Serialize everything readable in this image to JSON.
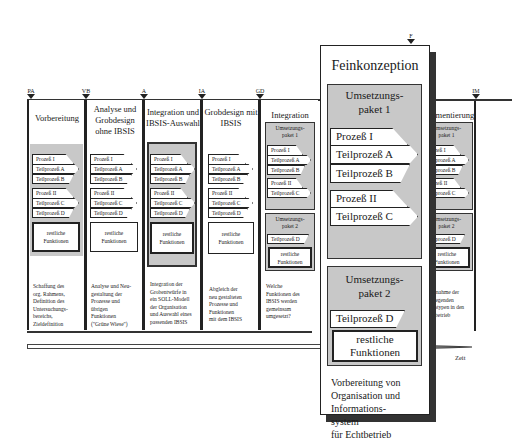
{
  "milestones": [
    "PA",
    "VB",
    "A",
    "IA",
    "GD",
    "F",
    "IM"
  ],
  "phases": [
    {
      "title": "Vorbereitung",
      "marker": "PA",
      "groups": [
        {
          "header": "Prozeß I",
          "items": [
            "Teilprozeß A",
            "Teilprozeß B"
          ]
        },
        {
          "header": "Prozeß II",
          "items": [
            "Teilprozeß C",
            "Teilprozeß D"
          ]
        }
      ],
      "rest": [
        "restliche",
        "Funktionen"
      ],
      "description": [
        "Schaffung des",
        "org. Rahmens,",
        "Definition des",
        "Untersuchungs-",
        "bereichs,",
        "Zieldefinition"
      ]
    },
    {
      "title": "Analyse und Grobdesign ohne IBSIS",
      "marker": "VB",
      "groups": [
        {
          "header": "Prozeß I",
          "items": [
            "Teilprozeß A",
            "Teilprozeß B"
          ]
        },
        {
          "header": "Prozeß II",
          "items": [
            "Teilprozeß C",
            "Teilprozeß D"
          ]
        }
      ],
      "rest": [
        "restliche",
        "Funktionen"
      ],
      "description": [
        "Analyse und Neu-",
        "gestaltung der",
        "Prozesse und",
        "übrigen",
        "Funktionen",
        "(\"Grüne Wiese\")"
      ]
    },
    {
      "title": "Integration und IBSIS-Auswahl",
      "marker": "A",
      "groups": [
        {
          "header": "Prozeß I",
          "items": [
            "Teilprozeß A",
            "Teilprozeß B"
          ]
        },
        {
          "header": "Prozeß II",
          "items": [
            "Teilprozeß C",
            "Teilprozeß D"
          ]
        }
      ],
      "rest": [
        "restliche",
        "Funktionen"
      ],
      "description": [
        "Integration der",
        "Grobentwürfe in",
        "ein SOLL-Modell",
        "der Organisation",
        "und Auswahl eines",
        "passenden IBSIS"
      ]
    },
    {
      "title": "Grobdesign mit IBSIS",
      "marker": "IA",
      "groups": [
        {
          "header": "Prozeß I",
          "items": [
            "Teilprozeß A",
            "Teilprozeß B"
          ]
        },
        {
          "header": "Prozeß II",
          "items": [
            "Teilprozeß C",
            "Teilprozeß D"
          ]
        }
      ],
      "rest": [
        "restliche",
        "Funktionen"
      ],
      "description": [
        "Abgleich der",
        "neu gestalteten",
        "Prozesse und",
        "Funktionen",
        "mit dem IBSIS"
      ]
    },
    {
      "title": "Integration",
      "marker": "GD",
      "paket1": {
        "label": [
          "Umsetzungs-",
          "paket 1"
        ],
        "p1": "Prozeß I",
        "p1items": [
          "Teilprozeß A",
          "Teilprozeß B"
        ],
        "p2": "Prozeß II",
        "p2items": [
          "Teilprozeß C"
        ]
      },
      "paket2": {
        "label": [
          "Umsetzungs-",
          "paket 2"
        ],
        "item": "Teilprozeß D"
      },
      "rest": [
        "restliche",
        "Funktionen"
      ],
      "description": [
        "Welche",
        "Funktionen des",
        "IBSIS werden",
        "gemeinsam",
        "umgesetzt?"
      ]
    },
    {
      "title": "Feinkonzeption",
      "marker": "F",
      "paket1": {
        "label": [
          "Umsetzungs-",
          "paket 1"
        ],
        "p1": "Prozeß I",
        "p1items": [
          "Teilprozeß A",
          "Teilprozeß B"
        ],
        "p2": "Prozeß II",
        "p2items": [
          "Teilprozeß C"
        ]
      },
      "paket2": {
        "label": [
          "Umsetzungs-",
          "paket 2"
        ],
        "item": "Teilprozeß D"
      },
      "rest": [
        "restliche",
        "Funktionen"
      ],
      "description": [
        "Vorbereitung von",
        "Organisation und",
        "Informations-",
        "system",
        "für Echtbetrieb"
      ]
    },
    {
      "title": "Implementierung",
      "marker": "IM",
      "paket1": {
        "label": [
          "Umsetzungs-",
          "paket 1"
        ],
        "p1": "Prozeß I",
        "p1items": [
          "Teilprozeß A",
          "Teilprozeß B"
        ],
        "p2": "Prozeß II",
        "p2items": [
          "Teilprozeß C"
        ]
      },
      "paket2": {
        "label": [
          "Umsetzungs-",
          "paket 2"
        ],
        "item": "Teilprozeß D"
      },
      "rest": [
        "restliche",
        "Funktionen"
      ],
      "description": [
        "Übernahme der",
        "vorliegenden",
        "Prototypen in den",
        "Echtbetrieb"
      ]
    }
  ],
  "axis": {
    "label": "Zeit"
  },
  "colors": {
    "gray_fill": "#c8c8c8",
    "line": "#222222"
  }
}
